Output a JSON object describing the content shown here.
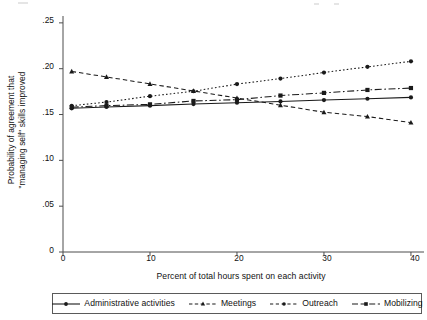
{
  "chart_data": {
    "type": "line",
    "title": "",
    "xlabel": "Percent of total hours spent on each activity",
    "ylabel_lines": [
      "Probability of agreement that",
      "\"managing self\" skills improved"
    ],
    "x": [
      1,
      5,
      10,
      15,
      20,
      25,
      30,
      35,
      40
    ],
    "xlim": [
      0,
      41.5
    ],
    "ylim": [
      0,
      0.2575
    ],
    "xticks": [
      "0",
      "10",
      "20",
      "30",
      "40"
    ],
    "xtick_values": [
      0,
      10,
      20,
      30,
      40
    ],
    "yticks": [
      "0",
      ".05",
      ".10",
      ".15",
      ".20",
      ".25"
    ],
    "ytick_values": [
      0,
      0.05,
      0.1,
      0.15,
      0.2,
      0.25
    ],
    "grid": false,
    "legend_position": "bottom",
    "series": [
      {
        "name": "Administrative activities",
        "line_style": "solid",
        "marker": "circle",
        "color": "#1a1a1a",
        "values": [
          0.1568,
          0.1583,
          0.1597,
          0.1614,
          0.1629,
          0.1643,
          0.1658,
          0.1672,
          0.1687
        ]
      },
      {
        "name": "Meetings",
        "line_style": "dashed",
        "marker": "triangle",
        "color": "#1a1a1a",
        "values": [
          0.197,
          0.191,
          0.1834,
          0.1757,
          0.168,
          0.1602,
          0.1525,
          0.1478,
          0.1412
        ]
      },
      {
        "name": "Outreach",
        "line_style": "dotted",
        "marker": "circle",
        "color": "#1a1a1a",
        "values": [
          0.1596,
          0.1636,
          0.17,
          0.1754,
          0.1832,
          0.1892,
          0.1958,
          0.202,
          0.208
        ]
      },
      {
        "name": "Mobilizing",
        "line_style": "dashdot",
        "marker": "square",
        "color": "#1a1a1a",
        "values": [
          0.158,
          0.1597,
          0.1611,
          0.1648,
          0.1662,
          0.1707,
          0.1736,
          0.1768,
          0.1789
        ]
      }
    ]
  }
}
